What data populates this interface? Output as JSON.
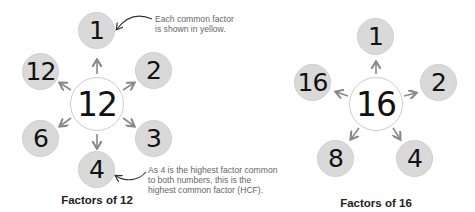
{
  "left": {
    "caption": "Factors of 12",
    "center": "12",
    "factors": [
      "1",
      "2",
      "3",
      "4",
      "6",
      "12"
    ],
    "note_top": [
      "Each common factor",
      "is shown in yellow."
    ],
    "note_bottom": [
      "As 4 is the highest factor common",
      "to both numbers, this is the",
      "highest common factor (HCF)."
    ]
  },
  "right": {
    "caption": "Factors of 16",
    "center": "16",
    "factors": [
      "1",
      "2",
      "4",
      "8",
      "16"
    ]
  },
  "colors": {
    "factor_fill": "#d9d9d9",
    "center_fill": "#ffffff",
    "arrow": "#888888",
    "note_text": "#666666"
  }
}
